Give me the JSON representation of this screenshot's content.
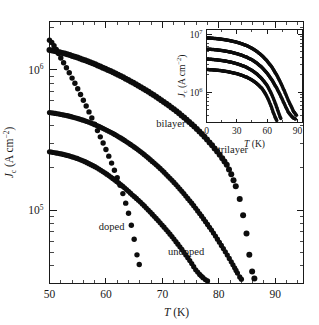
{
  "figure": {
    "name": "critical-current-density-vs-temperature",
    "background": "#ffffff",
    "ink_color": "#0d0d0d"
  },
  "chart_data": {
    "type": "scatter",
    "title": "",
    "xlabel": "T (K)",
    "xlabel_italic": "T",
    "xlabel_unit": "(K)",
    "ylabel": "Jc (A cm-2)",
    "ylabel_symbol": "J",
    "ylabel_sub": "c",
    "ylabel_unit_open": " (A cm",
    "ylabel_unit_sup": "-2",
    "ylabel_unit_close": ")",
    "xscale": "linear",
    "yscale": "log",
    "xlim": [
      50,
      95
    ],
    "ylim": [
      30000,
      2200000
    ],
    "xticks": [
      50,
      60,
      70,
      80,
      90
    ],
    "xticklabels": [
      "50",
      "60",
      "70",
      "80",
      "90"
    ],
    "yticks": [
      100000,
      1000000
    ],
    "yticklabels": [
      "10",
      "10"
    ],
    "yticklabels_exp": [
      "5",
      "6"
    ],
    "grid": false,
    "legend": "inline-annotations",
    "marker": "filled-circle",
    "series": [
      {
        "name": "doped",
        "label": "doped",
        "label_x": 61.0,
        "label_y": 72000,
        "points": [
          [
            50.0,
            1620000
          ],
          [
            50.4,
            1560000
          ],
          [
            50.8,
            1480000
          ],
          [
            51.2,
            1390000
          ],
          [
            51.6,
            1300000
          ],
          [
            52.0,
            1210000
          ],
          [
            52.5,
            1120000
          ],
          [
            53.0,
            1030000
          ],
          [
            53.5,
            950000
          ],
          [
            54.0,
            870000
          ],
          [
            54.5,
            800000
          ],
          [
            55.0,
            730000
          ],
          [
            55.5,
            665000
          ],
          [
            56.0,
            605000
          ],
          [
            56.5,
            550000
          ],
          [
            57.0,
            500000
          ],
          [
            57.5,
            452000
          ],
          [
            58.0,
            408000
          ],
          [
            58.5,
            368000
          ],
          [
            59.0,
            332000
          ],
          [
            59.5,
            300000
          ],
          [
            60.0,
            270000
          ],
          [
            60.5,
            242000
          ],
          [
            61.0,
            216000
          ],
          [
            61.5,
            192000
          ],
          [
            62.0,
            170000
          ],
          [
            62.5,
            150000
          ],
          [
            63.0,
            131000
          ],
          [
            63.5,
            112000
          ],
          [
            64.0,
            95000
          ],
          [
            64.5,
            78000
          ],
          [
            65.0,
            62000
          ],
          [
            65.5,
            48000
          ],
          [
            65.9,
            41000
          ]
        ]
      },
      {
        "name": "undoped",
        "label": "undoped",
        "label_x": 74.2,
        "label_y": 48000,
        "points": [
          [
            50.0,
            260000
          ],
          [
            50.7,
            257000
          ],
          [
            51.4,
            254000
          ],
          [
            52.1,
            251000
          ],
          [
            52.8,
            247000
          ],
          [
            53.5,
            243000
          ],
          [
            54.2,
            238000
          ],
          [
            54.9,
            233000
          ],
          [
            55.6,
            227000
          ],
          [
            56.3,
            221000
          ],
          [
            57.0,
            214000
          ],
          [
            57.7,
            207000
          ],
          [
            58.4,
            200000
          ],
          [
            59.1,
            192000
          ],
          [
            59.8,
            184000
          ],
          [
            60.5,
            176000
          ],
          [
            61.2,
            168000
          ],
          [
            61.9,
            160000
          ],
          [
            62.6,
            152000
          ],
          [
            63.3,
            144000
          ],
          [
            64.0,
            136000
          ],
          [
            64.7,
            128000
          ],
          [
            65.4,
            121000
          ],
          [
            66.1,
            114000
          ],
          [
            66.8,
            107000
          ],
          [
            67.5,
            100000
          ],
          [
            68.2,
            93500
          ],
          [
            68.9,
            87200
          ],
          [
            69.6,
            81200
          ],
          [
            70.3,
            75500
          ],
          [
            71.0,
            70000
          ],
          [
            71.7,
            64700
          ],
          [
            72.4,
            59600
          ],
          [
            73.1,
            54800
          ],
          [
            73.8,
            50200
          ],
          [
            74.5,
            45800
          ],
          [
            75.2,
            41600
          ],
          [
            75.9,
            37600
          ],
          [
            76.6,
            34800
          ],
          [
            77.2,
            33000
          ],
          [
            77.6,
            32000
          ],
          [
            78.0,
            31300
          ]
        ]
      },
      {
        "name": "bilayer",
        "label": "bilayer",
        "label_x": 71.5,
        "label_y": 390000,
        "points": [
          [
            50.0,
            495000
          ],
          [
            50.7,
            490000
          ],
          [
            51.4,
            485000
          ],
          [
            52.1,
            479000
          ],
          [
            52.8,
            473000
          ],
          [
            53.5,
            466000
          ],
          [
            54.2,
            458000
          ],
          [
            54.9,
            450000
          ],
          [
            55.6,
            441000
          ],
          [
            56.3,
            432000
          ],
          [
            57.0,
            422000
          ],
          [
            57.7,
            411000
          ],
          [
            58.4,
            400000
          ],
          [
            59.1,
            388000
          ],
          [
            59.8,
            376000
          ],
          [
            60.5,
            364000
          ],
          [
            61.2,
            352000
          ],
          [
            61.9,
            339000
          ],
          [
            62.6,
            326000
          ],
          [
            63.3,
            313000
          ],
          [
            64.0,
            300000
          ],
          [
            64.7,
            287000
          ],
          [
            65.4,
            274000
          ],
          [
            66.1,
            261000
          ],
          [
            66.8,
            248000
          ],
          [
            67.5,
            235000
          ],
          [
            68.2,
            222000
          ],
          [
            68.9,
            210000
          ],
          [
            69.6,
            198000
          ],
          [
            70.3,
            186000
          ],
          [
            71.0,
            174000
          ],
          [
            71.7,
            163000
          ],
          [
            72.4,
            152000
          ],
          [
            73.1,
            141000
          ],
          [
            73.8,
            131000
          ],
          [
            74.5,
            121000
          ],
          [
            75.2,
            112000
          ],
          [
            75.9,
            103000
          ],
          [
            76.6,
            94500
          ],
          [
            77.3,
            86500
          ],
          [
            78.0,
            79000
          ],
          [
            78.7,
            72000
          ],
          [
            79.4,
            65300
          ],
          [
            80.1,
            59000
          ],
          [
            80.8,
            53200
          ],
          [
            81.5,
            47800
          ],
          [
            82.2,
            42800
          ],
          [
            82.8,
            38800
          ],
          [
            83.3,
            35600
          ],
          [
            83.7,
            33400
          ],
          [
            84.0,
            32200
          ]
        ]
      },
      {
        "name": "trilayer",
        "label": "trilayer",
        "label_x": 82.5,
        "label_y": 255000,
        "points": [
          [
            50.0,
            1380000
          ],
          [
            50.9,
            1355000
          ],
          [
            51.8,
            1330000
          ],
          [
            52.7,
            1300000
          ],
          [
            53.6,
            1268000
          ],
          [
            54.5,
            1235000
          ],
          [
            55.4,
            1200000
          ],
          [
            56.3,
            1165000
          ],
          [
            57.2,
            1128000
          ],
          [
            58.1,
            1090000
          ],
          [
            59.0,
            1052000
          ],
          [
            59.9,
            1014000
          ],
          [
            60.8,
            976000
          ],
          [
            61.7,
            938000
          ],
          [
            62.6,
            900000
          ],
          [
            63.5,
            862000
          ],
          [
            64.4,
            824000
          ],
          [
            65.3,
            787000
          ],
          [
            66.2,
            750000
          ],
          [
            67.1,
            713000
          ],
          [
            68.0,
            677000
          ],
          [
            68.9,
            641000
          ],
          [
            69.8,
            606000
          ],
          [
            70.7,
            572000
          ],
          [
            71.6,
            538000
          ],
          [
            72.5,
            505000
          ],
          [
            73.4,
            472000
          ],
          [
            74.3,
            440000
          ],
          [
            75.2,
            409000
          ],
          [
            76.1,
            378000
          ],
          [
            77.0,
            348000
          ],
          [
            77.9,
            318000
          ],
          [
            78.8,
            289000
          ],
          [
            79.7,
            261000
          ],
          [
            80.6,
            234000
          ],
          [
            81.4,
            210000
          ],
          [
            82.2,
            180000
          ],
          [
            83.0,
            148000
          ],
          [
            83.7,
            120000
          ],
          [
            84.3,
            92000
          ],
          [
            84.9,
            68000
          ],
          [
            85.4,
            48000
          ],
          [
            85.9,
            36500
          ],
          [
            86.3,
            32500
          ]
        ]
      }
    ],
    "inset": {
      "name": "inset-plot",
      "xlabel": "T (K)",
      "xlabel_italic": "T",
      "xlabel_unit": "(K)",
      "ylabel_symbol": "J",
      "ylabel_sub": "c",
      "ylabel_unit_open": " (A cm",
      "ylabel_unit_sup": "-2",
      "ylabel_unit_close": ")",
      "xscale": "linear",
      "yscale": "log",
      "xlim": [
        0,
        95
      ],
      "ylim": [
        300000,
        12000000
      ],
      "xticks": [
        0,
        30,
        60,
        90
      ],
      "xticklabels": [
        "0",
        "30",
        "60",
        "90"
      ],
      "yticks": [
        1000000,
        10000000
      ],
      "yticklabels": [
        "10",
        "10"
      ],
      "yticklabels_exp": [
        "6",
        "7"
      ],
      "series": [
        {
          "name": "inset-curve-1",
          "points": [
            [
              1,
              8600000
            ],
            [
              5,
              8500000
            ],
            [
              10,
              8350000
            ],
            [
              15,
              8150000
            ],
            [
              20,
              7900000
            ],
            [
              25,
              7600000
            ],
            [
              30,
              7250000
            ],
            [
              35,
              6800000
            ],
            [
              40,
              6300000
            ],
            [
              45,
              5700000
            ],
            [
              50,
              5000000
            ],
            [
              55,
              4250000
            ],
            [
              60,
              3450000
            ],
            [
              65,
              2650000
            ],
            [
              70,
              1900000
            ],
            [
              74,
              1380000
            ],
            [
              78,
              960000
            ],
            [
              81,
              720000
            ],
            [
              84,
              560000
            ],
            [
              86,
              470000
            ],
            [
              88,
              420000
            ],
            [
              89,
              400000
            ]
          ]
        },
        {
          "name": "inset-curve-2",
          "points": [
            [
              1,
              5500000
            ],
            [
              5,
              5450000
            ],
            [
              10,
              5350000
            ],
            [
              15,
              5220000
            ],
            [
              20,
              5050000
            ],
            [
              25,
              4850000
            ],
            [
              30,
              4600000
            ],
            [
              35,
              4320000
            ],
            [
              40,
              3980000
            ],
            [
              45,
              3600000
            ],
            [
              50,
              3150000
            ],
            [
              55,
              2650000
            ],
            [
              60,
              2120000
            ],
            [
              65,
              1600000
            ],
            [
              70,
              1130000
            ],
            [
              74,
              820000
            ],
            [
              78,
              580000
            ],
            [
              81,
              450000
            ],
            [
              84,
              390000
            ],
            [
              86,
              360000
            ],
            [
              88,
              345000
            ]
          ]
        },
        {
          "name": "inset-curve-3",
          "points": [
            [
              1,
              3700000
            ],
            [
              5,
              3670000
            ],
            [
              10,
              3600000
            ],
            [
              15,
              3510000
            ],
            [
              20,
              3400000
            ],
            [
              25,
              3260000
            ],
            [
              30,
              3090000
            ],
            [
              35,
              2890000
            ],
            [
              40,
              2650000
            ],
            [
              45,
              2370000
            ],
            [
              50,
              2050000
            ],
            [
              55,
              1690000
            ],
            [
              60,
              1300000
            ],
            [
              64,
              960000
            ],
            [
              67,
              720000
            ],
            [
              69,
              580000
            ],
            [
              71,
              460000
            ],
            [
              72.5,
              390000
            ],
            [
              73.5,
              350000
            ]
          ]
        },
        {
          "name": "inset-curve-4",
          "points": [
            [
              1,
              2450000
            ],
            [
              5,
              2430000
            ],
            [
              10,
              2390000
            ],
            [
              15,
              2340000
            ],
            [
              20,
              2270000
            ],
            [
              25,
              2180000
            ],
            [
              30,
              2080000
            ],
            [
              35,
              1950000
            ],
            [
              40,
              1800000
            ],
            [
              45,
              1620000
            ],
            [
              50,
              1400000
            ],
            [
              55,
              1150000
            ],
            [
              58,
              960000
            ],
            [
              61,
              760000
            ],
            [
              64,
              570000
            ],
            [
              66,
              450000
            ],
            [
              68,
              370000
            ],
            [
              69.5,
              325000
            ]
          ]
        }
      ]
    }
  }
}
